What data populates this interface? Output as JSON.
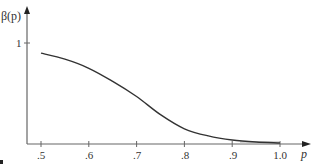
{
  "chart_data": {
    "type": "line",
    "title": "",
    "xlabel": "p",
    "ylabel": "β(p)",
    "x_tick_labels": [
      ".5",
      ".6",
      ".7",
      ".8",
      ".9",
      "1.0"
    ],
    "x_ticks": [
      0.5,
      0.6,
      0.7,
      0.8,
      0.9,
      1.0
    ],
    "y_tick_labels": [
      "1"
    ],
    "y_ticks": [
      1
    ],
    "xlim": [
      0.47,
      1.06
    ],
    "ylim": [
      0,
      1.35
    ],
    "grid": false,
    "legend": null,
    "series": [
      {
        "name": "β(p)",
        "x": [
          0.5,
          0.55,
          0.6,
          0.65,
          0.7,
          0.75,
          0.8,
          0.85,
          0.9,
          0.95,
          1.0
        ],
        "values": [
          0.9,
          0.84,
          0.75,
          0.62,
          0.47,
          0.29,
          0.15,
          0.08,
          0.04,
          0.02,
          0.01
        ]
      }
    ]
  },
  "labels": {
    "y_axis": "β(p)",
    "x_axis": "p",
    "y_tick_1": "1",
    "x_ticks": [
      ".5",
      ".6",
      ".7",
      ".8",
      ".9",
      "1.0"
    ]
  },
  "colors": {
    "axis": "#666666",
    "curve": "#333333",
    "text": "#333333"
  }
}
